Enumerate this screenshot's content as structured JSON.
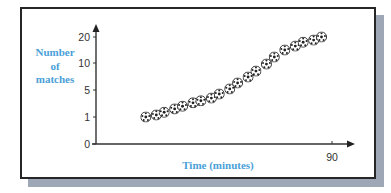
{
  "chart_data": {
    "type": "scatter",
    "title": "",
    "xlabel": "Time (minutes)",
    "ylabel": "Number of matches",
    "ylabel_lines": [
      "Number",
      "of",
      "matches"
    ],
    "x_ticks": [
      {
        "value": 90,
        "label": "90"
      }
    ],
    "y_ticks": [
      {
        "value": 0,
        "label": "0"
      },
      {
        "value": 1,
        "label": "1"
      },
      {
        "value": 5,
        "label": "5"
      },
      {
        "value": 10,
        "label": "10"
      },
      {
        "value": 20,
        "label": "20"
      }
    ],
    "y_scale": "non-linear (0, 1, 5, 10, 20 equally spaced)",
    "xlim": [
      0,
      95
    ],
    "ylim": [
      0,
      22
    ],
    "grid": false,
    "legend": null,
    "marker": "football-icon",
    "x": [
      19,
      23,
      26,
      30,
      33,
      37,
      40,
      44,
      47,
      51,
      54,
      58,
      61,
      65,
      68,
      72,
      76,
      79,
      83,
      86
    ],
    "values": [
      1,
      1.3,
      1.7,
      2.2,
      2.6,
      3.1,
      3.4,
      3.8,
      4.4,
      5.2,
      6.3,
      7.4,
      8.5,
      9.8,
      12.3,
      15,
      16.5,
      18,
      18.8,
      20
    ],
    "colors": {
      "label": "#4a9fd8",
      "axis": "#333333",
      "frame_border": "#262626",
      "shadow": "#9ea7b6"
    }
  }
}
